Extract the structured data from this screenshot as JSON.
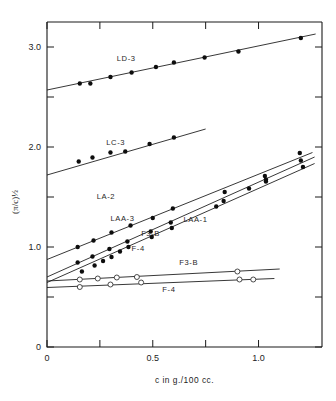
{
  "chart_data": {
    "type": "scatter",
    "title": "",
    "xlabel": "c in g./100 cc.",
    "ylabel": "(π/c)½",
    "xlim": [
      0,
      1.3
    ],
    "ylim": [
      0,
      3.25
    ],
    "grid": false,
    "legend_position": "inline-labels",
    "x_ticks": [
      {
        "value": 0,
        "label": "0",
        "major": true
      },
      {
        "value": 0.25,
        "label": "",
        "major": true
      },
      {
        "value": 0.5,
        "label": "0.5",
        "major": true
      },
      {
        "value": 0.75,
        "label": "",
        "major": true
      },
      {
        "value": 1.0,
        "label": "1.0",
        "major": true
      }
    ],
    "y_ticks": [
      {
        "value": 0,
        "label": "0",
        "major": true
      },
      {
        "value": 0.5,
        "label": "",
        "major": true
      },
      {
        "value": 1.0,
        "label": "1.0",
        "major": true
      },
      {
        "value": 1.5,
        "label": "",
        "major": true
      },
      {
        "value": 2.0,
        "label": "2.0",
        "major": true
      },
      {
        "value": 2.5,
        "label": "",
        "major": true
      },
      {
        "value": 3.0,
        "label": "3.0",
        "major": true
      }
    ],
    "series": [
      {
        "name": "LD-3",
        "marker": "filled-circle",
        "label_x": 0.33,
        "label_y": 2.86,
        "line": [
          [
            0.0,
            2.57
          ],
          [
            1.27,
            3.13
          ]
        ],
        "points": [
          [
            0.155,
            2.635
          ],
          [
            0.205,
            2.635
          ],
          [
            0.3,
            2.7
          ],
          [
            0.4,
            2.745
          ],
          [
            0.515,
            2.8
          ],
          [
            0.6,
            2.845
          ],
          [
            0.745,
            2.895
          ],
          [
            0.905,
            2.955
          ],
          [
            1.2,
            3.09
          ]
        ]
      },
      {
        "name": "LC-3",
        "marker": "filled-circle",
        "label_x": 0.28,
        "label_y": 2.02,
        "line": [
          [
            0.0,
            1.72
          ],
          [
            0.75,
            2.18
          ]
        ],
        "points": [
          [
            0.15,
            1.855
          ],
          [
            0.215,
            1.895
          ],
          [
            0.3,
            1.945
          ],
          [
            0.37,
            1.955
          ],
          [
            0.485,
            2.03
          ],
          [
            0.6,
            2.095
          ]
        ]
      },
      {
        "name": "LA-2",
        "marker": "filled-circle",
        "label_x": 0.235,
        "label_y": 1.485,
        "line": [
          [
            0.0,
            0.875
          ],
          [
            1.255,
            1.945
          ]
        ],
        "points": [
          [
            0.145,
            1.0
          ],
          [
            0.22,
            1.065
          ],
          [
            0.305,
            1.145
          ],
          [
            0.395,
            1.215
          ],
          [
            0.5,
            1.29
          ],
          [
            0.595,
            1.385
          ],
          [
            0.84,
            1.55
          ],
          [
            1.03,
            1.71
          ],
          [
            1.195,
            1.94
          ]
        ]
      },
      {
        "name": "LAA-3",
        "marker": "filled-circle",
        "label_x": 0.3,
        "label_y": 1.265,
        "line": [
          [
            0.0,
            0.7
          ],
          [
            1.265,
            1.9
          ]
        ],
        "points": [
          [
            0.145,
            0.845
          ],
          [
            0.215,
            0.905
          ],
          [
            0.295,
            0.98
          ],
          [
            0.38,
            1.055
          ],
          [
            0.49,
            1.155
          ],
          [
            0.585,
            1.245
          ],
          [
            0.835,
            1.46
          ],
          [
            1.035,
            1.675
          ],
          [
            1.2,
            1.865
          ]
        ]
      },
      {
        "name": "LAA-1",
        "marker": "filled-circle",
        "label_x": 0.645,
        "label_y": 1.255,
        "line": [
          [
            0.0,
            0.645
          ],
          [
            1.265,
            1.835
          ]
        ],
        "points": [
          [
            0.165,
            0.755
          ],
          [
            0.225,
            0.815
          ],
          [
            0.265,
            0.86
          ],
          [
            0.305,
            0.9
          ],
          [
            0.345,
            0.955
          ],
          [
            0.385,
            1.0
          ],
          [
            0.495,
            1.1
          ],
          [
            0.59,
            1.19
          ],
          [
            0.8,
            1.405
          ],
          [
            0.955,
            1.585
          ],
          [
            1.035,
            1.655
          ],
          [
            1.21,
            1.8
          ]
        ]
      },
      {
        "name": "F3-B",
        "marker": "open-circle",
        "label_x": 0.625,
        "label_y": 0.825,
        "line": [
          [
            0.0,
            0.66
          ],
          [
            1.1,
            0.78
          ]
        ],
        "points": [
          [
            0.155,
            0.675
          ],
          [
            0.24,
            0.685
          ],
          [
            0.33,
            0.695
          ],
          [
            0.425,
            0.7
          ],
          [
            0.9,
            0.755
          ]
        ]
      },
      {
        "name": "F-4",
        "marker": "open-circle",
        "label_x": 0.545,
        "label_y": 0.555,
        "line": [
          [
            0.0,
            0.595
          ],
          [
            1.075,
            0.685
          ]
        ],
        "points": [
          [
            0.155,
            0.6
          ],
          [
            0.3,
            0.625
          ],
          [
            0.445,
            0.645
          ],
          [
            0.91,
            0.675
          ],
          [
            0.975,
            0.675
          ]
        ]
      }
    ],
    "inline_labels": [
      {
        "text": "F3-B",
        "x": 0.445,
        "y": 1.11
      },
      {
        "text": "F-4",
        "x": 0.4,
        "y": 0.96
      }
    ]
  }
}
